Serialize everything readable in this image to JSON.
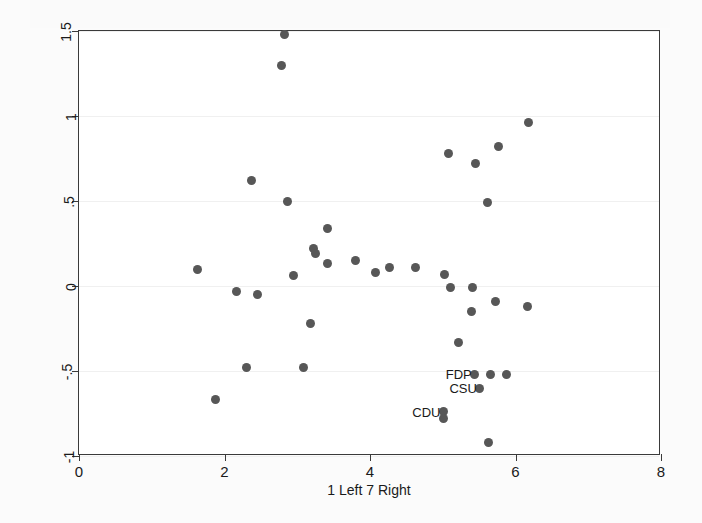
{
  "chart_data": {
    "type": "scatter",
    "title": "",
    "xlabel": "1 Left 7 Right",
    "ylabel": "Positive 2013 More Positive about EU Demo",
    "xlim": [
      0,
      8
    ],
    "ylim": [
      -1,
      1.5
    ],
    "xticks": [
      0,
      2,
      4,
      6,
      8
    ],
    "xtick_labels": [
      "0",
      "2",
      "4",
      "6",
      "8"
    ],
    "yticks": [
      -1,
      -0.5,
      0,
      0.5,
      1,
      1.5
    ],
    "ytick_labels": [
      "-1",
      "-.5",
      "0",
      ".5",
      "1",
      "1.5"
    ],
    "grid": true,
    "grid_axis": "y",
    "legend": "none",
    "marker_color": "#575757",
    "marker_size": 9,
    "points": [
      {
        "x": 2.82,
        "y": 1.48,
        "label": ""
      },
      {
        "x": 2.78,
        "y": 1.3,
        "label": ""
      },
      {
        "x": 2.37,
        "y": 0.62,
        "label": ""
      },
      {
        "x": 2.87,
        "y": 0.5,
        "label": ""
      },
      {
        "x": 5.08,
        "y": 0.78,
        "label": ""
      },
      {
        "x": 5.45,
        "y": 0.72,
        "label": ""
      },
      {
        "x": 5.77,
        "y": 0.82,
        "label": ""
      },
      {
        "x": 6.18,
        "y": 0.96,
        "label": ""
      },
      {
        "x": 5.62,
        "y": 0.49,
        "label": ""
      },
      {
        "x": 3.42,
        "y": 0.34,
        "label": ""
      },
      {
        "x": 3.22,
        "y": 0.22,
        "label": ""
      },
      {
        "x": 3.25,
        "y": 0.19,
        "label": ""
      },
      {
        "x": 3.41,
        "y": 0.13,
        "label": ""
      },
      {
        "x": 3.8,
        "y": 0.15,
        "label": ""
      },
      {
        "x": 4.07,
        "y": 0.08,
        "label": ""
      },
      {
        "x": 4.27,
        "y": 0.11,
        "label": ""
      },
      {
        "x": 4.63,
        "y": 0.11,
        "label": ""
      },
      {
        "x": 5.03,
        "y": 0.07,
        "label": ""
      },
      {
        "x": 1.63,
        "y": 0.1,
        "label": ""
      },
      {
        "x": 2.17,
        "y": -0.03,
        "label": ""
      },
      {
        "x": 2.45,
        "y": -0.05,
        "label": ""
      },
      {
        "x": 2.95,
        "y": 0.06,
        "label": ""
      },
      {
        "x": 5.1,
        "y": -0.01,
        "label": ""
      },
      {
        "x": 5.41,
        "y": -0.01,
        "label": ""
      },
      {
        "x": 5.4,
        "y": -0.15,
        "label": ""
      },
      {
        "x": 5.72,
        "y": -0.09,
        "label": ""
      },
      {
        "x": 6.17,
        "y": -0.12,
        "label": ""
      },
      {
        "x": 3.18,
        "y": -0.22,
        "label": ""
      },
      {
        "x": 5.22,
        "y": -0.33,
        "label": ""
      },
      {
        "x": 2.3,
        "y": -0.48,
        "label": ""
      },
      {
        "x": 3.09,
        "y": -0.48,
        "label": ""
      },
      {
        "x": 5.44,
        "y": -0.52,
        "label": "FDP"
      },
      {
        "x": 5.65,
        "y": -0.52,
        "label": ""
      },
      {
        "x": 5.87,
        "y": -0.52,
        "label": ""
      },
      {
        "x": 5.51,
        "y": -0.6,
        "label": "CSU"
      },
      {
        "x": 5.01,
        "y": -0.74,
        "label": "CDU"
      },
      {
        "x": 5.01,
        "y": -0.78,
        "label": ""
      },
      {
        "x": 1.87,
        "y": -0.67,
        "label": ""
      },
      {
        "x": 5.63,
        "y": -0.92,
        "label": ""
      }
    ]
  },
  "axis": {
    "x_title": "1 Left 7 Right",
    "y_title": "Positive 2013 More Positive about EU Demo"
  },
  "annotations": [
    {
      "text": "FDP"
    },
    {
      "text": "CSU"
    },
    {
      "text": "CDU"
    }
  ]
}
